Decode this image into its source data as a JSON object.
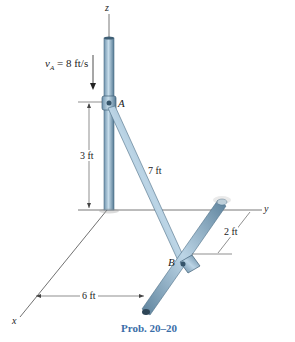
{
  "diagram": {
    "axes": {
      "z": "z",
      "y": "y",
      "x": "x"
    },
    "points": {
      "A": "A",
      "B": "B"
    },
    "velocity_label": "v",
    "velocity_sub": "A",
    "velocity_value": " = 8 ft/s",
    "dimensions": {
      "height_A": "3 ft",
      "rod_length": "7 ft",
      "offset_B": "2 ft",
      "distance_x": "6 ft"
    },
    "caption": "Prob. 20–20",
    "colors": {
      "rod": "#8fb4cc",
      "rod_dark": "#5a7f99",
      "caption": "#3a6ea8",
      "line": "#333333"
    }
  }
}
